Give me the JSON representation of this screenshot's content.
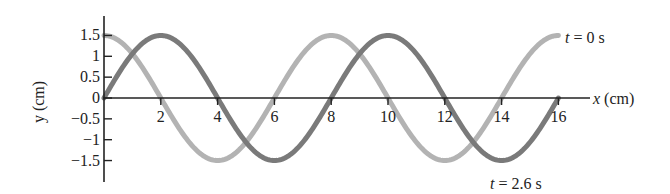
{
  "chart_data": {
    "type": "line",
    "title": "",
    "xlabel": "x (cm)",
    "ylabel": "y (cm)",
    "xlim": [
      0,
      16
    ],
    "ylim": [
      -1.5,
      1.5
    ],
    "x_ticks": [
      "2",
      "4",
      "6",
      "8",
      "10",
      "12",
      "14",
      "16"
    ],
    "y_ticks": [
      "1.5",
      "1",
      "0.5",
      "0",
      "−0.5",
      "−1",
      "−1.5"
    ],
    "grid": false,
    "x": [
      0,
      1,
      2,
      3,
      4,
      5,
      6,
      7,
      8,
      9,
      10,
      11,
      12,
      13,
      14,
      15,
      16
    ],
    "series": [
      {
        "name": "t = 0 s",
        "color": "#b3b3b3",
        "function": "1.5*cos(pi*x/4)",
        "values": [
          1.5,
          1.06,
          0,
          -1.06,
          -1.5,
          -1.06,
          0,
          1.06,
          1.5,
          1.06,
          0,
          -1.06,
          -1.5,
          -1.06,
          0,
          1.06,
          1.5
        ]
      },
      {
        "name": "t = 2.6 s",
        "color": "#7a7a7a",
        "function": "1.5*sin(pi*x/4)",
        "values": [
          0,
          1.06,
          1.5,
          1.06,
          0,
          -1.06,
          -1.5,
          -1.06,
          0,
          1.06,
          1.5,
          1.06,
          0,
          -1.06,
          -1.5,
          -1.06,
          0
        ]
      }
    ],
    "annotations": [
      {
        "text_parts": [
          "t",
          " = 0 s"
        ],
        "near": "end of light curve, top right"
      },
      {
        "text_parts": [
          "t",
          " = 2.6 s"
        ],
        "near": "below dark curve minimum, bottom right"
      }
    ]
  },
  "labels": {
    "x_axis_italic": "x",
    "x_axis_unit": " (cm)",
    "y_axis": "y (cm)",
    "t0_var": "t",
    "t0_rest": " = 0 s",
    "t26_var": "t",
    "t26_rest": " = 2.6 s"
  }
}
